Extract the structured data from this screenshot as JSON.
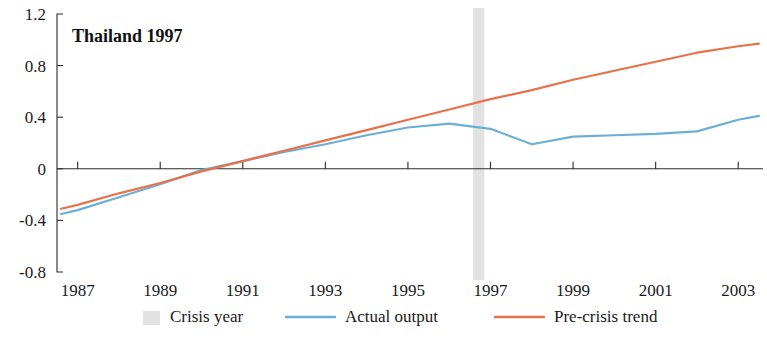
{
  "chart_data": {
    "type": "line",
    "title": "Thailand 1997",
    "xlabel": "",
    "ylabel": "",
    "xlim": [
      1986.5,
      2003.6
    ],
    "ylim": [
      -0.8,
      1.2
    ],
    "grid": false,
    "legend_position": "bottom-center",
    "x_ticks": [
      "1987",
      "1989",
      "1991",
      "1993",
      "1995",
      "1997",
      "1999",
      "2001",
      "2003"
    ],
    "x_tick_values": [
      1987,
      1989,
      1991,
      1993,
      1995,
      1997,
      1999,
      2001,
      2003
    ],
    "y_ticks": [
      "1.2",
      "0.8",
      "0.4",
      "0",
      "-0.4",
      "-0.8"
    ],
    "y_tick_values": [
      1.2,
      0.8,
      0.4,
      0,
      -0.4,
      -0.8
    ],
    "x": [
      1986.6,
      1987,
      1988,
      1989,
      1990,
      1991,
      1992,
      1993,
      1994,
      1995,
      1996,
      1997,
      1998,
      1999,
      2000,
      2001,
      2002,
      2003,
      2003.5
    ],
    "series": [
      {
        "name": "Actual output",
        "color": "#6cafd4",
        "values": [
          -0.35,
          -0.32,
          -0.22,
          -0.12,
          -0.01,
          0.06,
          0.13,
          0.19,
          0.26,
          0.32,
          0.35,
          0.31,
          0.19,
          0.25,
          0.26,
          0.27,
          0.29,
          0.38,
          0.41
        ]
      },
      {
        "name": "Pre-crisis trend",
        "color": "#e8714a",
        "values": [
          -0.31,
          -0.28,
          -0.19,
          -0.11,
          -0.02,
          0.06,
          0.14,
          0.22,
          0.3,
          0.38,
          0.46,
          0.54,
          0.61,
          0.69,
          0.76,
          0.83,
          0.9,
          0.95,
          0.97
        ]
      }
    ],
    "annotations": [
      {
        "name": "crisis-year-band",
        "type": "vspan",
        "x_start": 1996.58,
        "x_end": 1996.85,
        "color": "#e2e2e2",
        "label": "Crisis year"
      }
    ],
    "legend": [
      {
        "label": "Crisis year",
        "marker": "swatch",
        "color": "#e2e2e2"
      },
      {
        "label": "Actual output",
        "marker": "line",
        "color": "#6cafd4"
      },
      {
        "label": "Pre-crisis trend",
        "marker": "line",
        "color": "#e8714a"
      }
    ]
  },
  "style": {
    "axis_color": "#2b2b2b",
    "background": "#ffffff",
    "text_color": "#1a1a1a"
  }
}
